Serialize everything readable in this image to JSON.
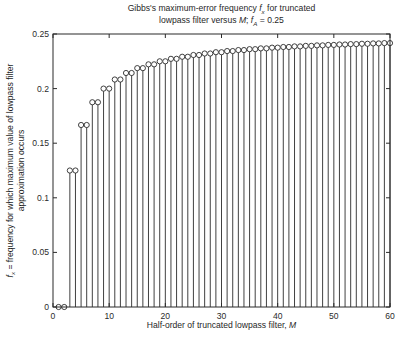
{
  "title": {
    "line1_pre": "Gibbs's maximum-error frequency ",
    "fx_f": "f",
    "fx_sub": "x",
    "line1_post": " for truncated",
    "line2_pre": "lowpass filter versus ",
    "M": "M",
    "line2_mid": "; ",
    "fa_f": "f",
    "fa_sub": "A",
    "line2_post": " = 0.25"
  },
  "axes": {
    "xlabel_pre": "Half-order of truncated lowpass filter, ",
    "xlabel_M": "M",
    "ylabel_f": "f",
    "ylabel_sub": "x",
    "ylabel_line1_rest": " = frequency for which maximum value of lowpass filter",
    "ylabel_line2": "approximation occurs"
  },
  "chart_data": {
    "type": "stem",
    "title": "Gibbs's maximum-error frequency fx for truncated lowpass filter versus M; fA = 0.25",
    "xlabel": "Half-order of truncated lowpass filter, M",
    "ylabel": "fx = frequency for which maximum value of lowpass filter approximation occurs",
    "marker": "open-circle",
    "grid": false,
    "legend": null,
    "ink_color": "#2b2b2b",
    "background": "#ffffff",
    "xlim": [
      0,
      60
    ],
    "ylim": [
      0,
      0.25
    ],
    "xticks": [
      0,
      10,
      20,
      30,
      40,
      50,
      60
    ],
    "xtick_labels": [
      "0",
      "10",
      "20",
      "30",
      "40",
      "50",
      "60"
    ],
    "yticks": [
      0,
      0.05,
      0.1,
      0.15,
      0.2,
      0.25
    ],
    "ytick_labels": [
      "0",
      "0.05",
      "0.1",
      "0.15",
      "0.2",
      "0.25"
    ],
    "x": [
      1,
      2,
      3,
      4,
      5,
      6,
      7,
      8,
      9,
      10,
      11,
      12,
      13,
      14,
      15,
      16,
      17,
      18,
      19,
      20,
      21,
      22,
      23,
      24,
      25,
      26,
      27,
      28,
      29,
      30,
      31,
      32,
      33,
      34,
      35,
      36,
      37,
      38,
      39,
      40,
      41,
      42,
      43,
      44,
      45,
      46,
      47,
      48,
      49,
      50,
      51,
      52,
      53,
      54,
      55,
      56,
      57,
      58,
      59,
      60
    ],
    "y": [
      0,
      0,
      0.125,
      0.125,
      0.16667,
      0.16667,
      0.1875,
      0.1875,
      0.2,
      0.2,
      0.20833,
      0.20833,
      0.21429,
      0.21429,
      0.21875,
      0.21875,
      0.22222,
      0.22222,
      0.225,
      0.225,
      0.22727,
      0.22727,
      0.22917,
      0.22917,
      0.23077,
      0.23077,
      0.23214,
      0.23214,
      0.23333,
      0.23333,
      0.23438,
      0.23438,
      0.23529,
      0.23529,
      0.23611,
      0.23611,
      0.23684,
      0.23684,
      0.2375,
      0.2375,
      0.2381,
      0.2381,
      0.23864,
      0.23864,
      0.23913,
      0.23913,
      0.23958,
      0.23958,
      0.24,
      0.24,
      0.24038,
      0.24038,
      0.24074,
      0.24074,
      0.24107,
      0.24107,
      0.24138,
      0.24138,
      0.24167,
      0.24167
    ]
  }
}
